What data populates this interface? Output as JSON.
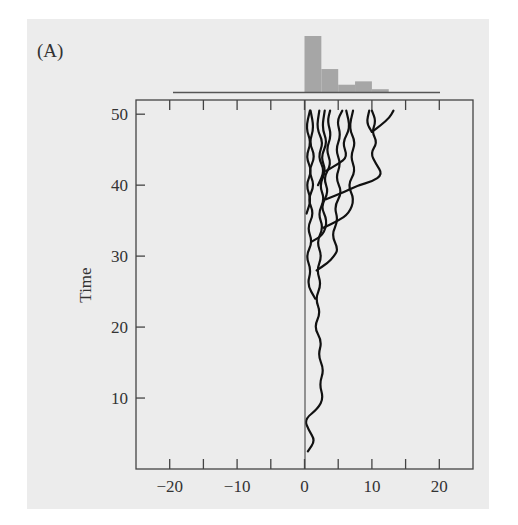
{
  "chart_data": {
    "type": "line",
    "panel_label": "(A)",
    "title": "",
    "xlabel": "",
    "ylabel": "Time",
    "xlim": [
      -25,
      25
    ],
    "ylim": [
      0,
      52
    ],
    "x_ticks": [
      -20,
      -15,
      -10,
      -5,
      0,
      5,
      10,
      15,
      20
    ],
    "x_tick_labels": [
      "−20",
      "−10",
      "0",
      "10",
      "20"
    ],
    "x_tick_label_values": [
      -20,
      -10,
      0,
      10,
      20
    ],
    "y_ticks": [
      10,
      20,
      30,
      40,
      50
    ],
    "y_tick_labels": [
      "10",
      "20",
      "30",
      "40",
      "50"
    ],
    "grid": false,
    "reflecting_boundary_x": 0,
    "histogram": {
      "type": "bar",
      "bin_edges": [
        0,
        2.5,
        5,
        7.5,
        10,
        12.5
      ],
      "relative_heights": [
        1.0,
        0.41,
        0.13,
        0.19,
        0.05
      ],
      "baseline_range": [
        -20,
        20
      ]
    },
    "series": [
      {
        "name": "trajectory-1",
        "points": [
          [
            0.5,
            2.5
          ],
          [
            1.6,
            4
          ],
          [
            0.6,
            5.5
          ],
          [
            0,
            7
          ],
          [
            2.0,
            8.5
          ],
          [
            2.8,
            10
          ],
          [
            2.2,
            12
          ],
          [
            2.9,
            14
          ],
          [
            2.0,
            16
          ],
          [
            2.6,
            18
          ],
          [
            1.4,
            20
          ],
          [
            2.4,
            22
          ],
          [
            1.6,
            24
          ],
          [
            2.5,
            26
          ],
          [
            1.8,
            28
          ],
          [
            2.6,
            30
          ],
          [
            1.8,
            32
          ],
          [
            2.8,
            34
          ],
          [
            2.0,
            36
          ],
          [
            3.0,
            38
          ],
          [
            2.2,
            40
          ],
          [
            3.2,
            42
          ],
          [
            2.4,
            44
          ],
          [
            3.4,
            46
          ],
          [
            2.6,
            48
          ],
          [
            3.0,
            50.5
          ]
        ]
      },
      {
        "name": "trajectory-2",
        "points": [
          [
            1.6,
            24
          ],
          [
            0.4,
            26
          ],
          [
            1.0,
            28
          ],
          [
            0.2,
            30
          ],
          [
            1.2,
            32
          ],
          [
            0.4,
            34
          ],
          [
            1.4,
            36
          ],
          [
            0.5,
            38
          ],
          [
            1.5,
            40
          ],
          [
            0.6,
            42
          ],
          [
            1.6,
            44
          ],
          [
            0.7,
            46
          ],
          [
            1.4,
            48
          ],
          [
            0.9,
            50.5
          ]
        ]
      },
      {
        "name": "trajectory-3",
        "points": [
          [
            1.8,
            28
          ],
          [
            3.4,
            29
          ],
          [
            4.4,
            30
          ],
          [
            5.0,
            31
          ],
          [
            4.0,
            33
          ],
          [
            5.0,
            35
          ],
          [
            4.4,
            37
          ],
          [
            5.6,
            39
          ],
          [
            4.6,
            41
          ],
          [
            5.4,
            43
          ],
          [
            4.6,
            45
          ],
          [
            5.4,
            47
          ],
          [
            4.8,
            49
          ],
          [
            5.6,
            50.5
          ]
        ]
      },
      {
        "name": "trajectory-4",
        "points": [
          [
            2.8,
            34
          ],
          [
            5.0,
            35
          ],
          [
            6.6,
            36
          ],
          [
            7.4,
            38
          ],
          [
            6.4,
            40
          ],
          [
            7.6,
            42
          ],
          [
            6.8,
            44
          ],
          [
            7.6,
            46
          ],
          [
            6.6,
            48
          ],
          [
            7.2,
            50.5
          ]
        ]
      },
      {
        "name": "trajectory-5",
        "points": [
          [
            3.2,
            38
          ],
          [
            5.8,
            39
          ],
          [
            8.0,
            40
          ],
          [
            10.0,
            40.5
          ],
          [
            11.6,
            41.5
          ],
          [
            10.6,
            43
          ],
          [
            9.8,
            44.5
          ],
          [
            10.8,
            46
          ],
          [
            10.0,
            47.5
          ],
          [
            10.6,
            49
          ],
          [
            10.0,
            50.5
          ]
        ]
      },
      {
        "name": "trajectory-6",
        "points": [
          [
            10.0,
            47.5
          ],
          [
            11.4,
            48.5
          ],
          [
            12.6,
            49.5
          ],
          [
            13.2,
            50.5
          ]
        ]
      },
      {
        "name": "trajectory-7",
        "points": [
          [
            10.0,
            47.5
          ],
          [
            9.2,
            48.8
          ],
          [
            9.6,
            50.5
          ]
        ]
      },
      {
        "name": "trajectory-8",
        "points": [
          [
            1.0,
            32
          ],
          [
            2.8,
            33
          ],
          [
            3.4,
            35
          ],
          [
            2.4,
            37
          ],
          [
            3.6,
            39
          ],
          [
            2.8,
            41
          ],
          [
            4.0,
            43
          ],
          [
            3.2,
            45
          ],
          [
            4.0,
            47
          ],
          [
            3.4,
            49
          ],
          [
            3.8,
            50.5
          ]
        ]
      },
      {
        "name": "trajectory-9",
        "points": [
          [
            0.3,
            36
          ],
          [
            1.0,
            38
          ],
          [
            0.2,
            40
          ],
          [
            1.1,
            42
          ],
          [
            0.2,
            44
          ],
          [
            1.0,
            46
          ],
          [
            0.2,
            48
          ],
          [
            0.8,
            50.5
          ]
        ]
      },
      {
        "name": "trajectory-10",
        "points": [
          [
            2.0,
            40
          ],
          [
            3.0,
            42
          ],
          [
            2.0,
            44
          ],
          [
            2.8,
            46
          ],
          [
            1.8,
            48
          ],
          [
            2.2,
            50.5
          ]
        ]
      },
      {
        "name": "trajectory-11",
        "points": [
          [
            3.2,
            42
          ],
          [
            5.0,
            43
          ],
          [
            6.4,
            44
          ],
          [
            5.6,
            46
          ],
          [
            6.8,
            48
          ],
          [
            6.2,
            50.5
          ]
        ]
      }
    ]
  }
}
